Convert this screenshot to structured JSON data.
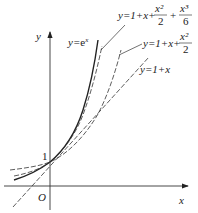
{
  "figure": {
    "axes": {
      "x_label": "x",
      "y_label": "y",
      "origin_label": "O",
      "y_tick_label": "1"
    },
    "curves": [
      {
        "name": "exp",
        "label_y": "y=",
        "label_rest": "e",
        "label_sup": "x",
        "style": "solid"
      },
      {
        "name": "cubic",
        "label": "y=1+x+",
        "frac1_num": "x²",
        "frac1_den": "2",
        "plus": "+",
        "frac2_num": "x³",
        "frac2_den": "6",
        "style": "dashed"
      },
      {
        "name": "quadratic",
        "label": "y=1+x+",
        "frac1_num": "x²",
        "frac1_den": "2",
        "style": "dashed"
      },
      {
        "name": "linear",
        "label": "y=1+x",
        "style": "dashed"
      }
    ],
    "colors": {
      "line": "#222222",
      "background": "#ffffff"
    }
  }
}
